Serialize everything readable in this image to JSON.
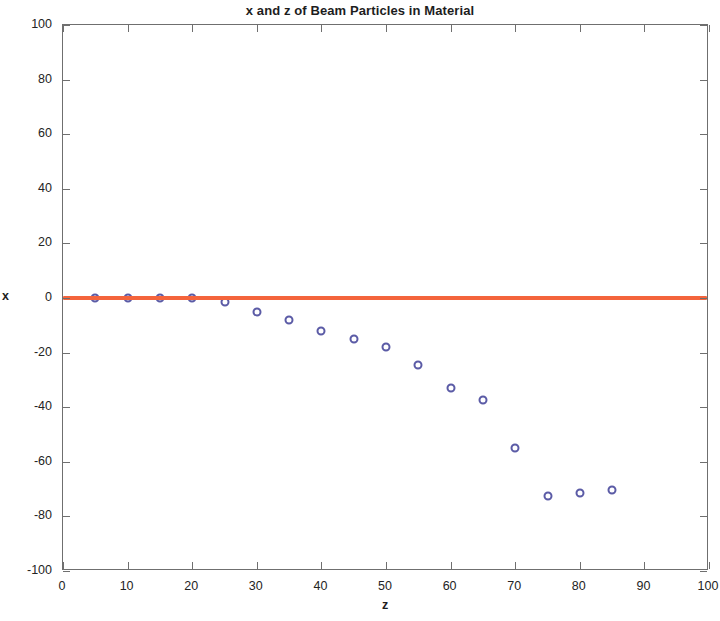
{
  "chart_data": {
    "type": "scatter",
    "title": "x and z of Beam Particles in Material",
    "xlabel": "z",
    "ylabel": "x",
    "xlim": [
      0,
      100
    ],
    "ylim": [
      -100,
      100
    ],
    "xticks": [
      0,
      10,
      20,
      30,
      40,
      50,
      60,
      70,
      80,
      90,
      100
    ],
    "yticks": [
      -100,
      -80,
      -60,
      -40,
      -20,
      0,
      20,
      40,
      60,
      80,
      100
    ],
    "grid": false,
    "legend": null,
    "series": [
      {
        "name": "beam particles",
        "marker": "circle-open",
        "color": "#5b5ba6",
        "x": [
          5,
          10,
          15,
          20,
          25,
          30,
          35,
          40,
          45,
          50,
          55,
          60,
          65,
          70,
          75,
          80,
          85
        ],
        "y": [
          0,
          0,
          0,
          0,
          -1.5,
          -5,
          -8,
          -12,
          -15,
          -18,
          -24.5,
          -33,
          -37.5,
          -55,
          -72.5,
          -71.5,
          -70.5
        ]
      },
      {
        "name": "reference line",
        "marker": "line",
        "color": "#f4643c",
        "x": [
          0,
          100
        ],
        "y": [
          0,
          0
        ]
      }
    ]
  },
  "figure": {
    "title": "x and z of Beam Particles in Material",
    "xlabel": "z",
    "ylabel": "x",
    "xticklabels": [
      "0",
      "10",
      "20",
      "30",
      "40",
      "50",
      "60",
      "70",
      "80",
      "90",
      "100"
    ],
    "yticklabels": [
      "100",
      "80",
      "60",
      "40",
      "20",
      "0",
      "-20",
      "-40",
      "-60",
      "-80",
      "-100"
    ],
    "marker_color": "#5b5ba6",
    "line_color": "#f4643c",
    "axis_color": "#6f6f6f",
    "background": "#ffffff"
  }
}
